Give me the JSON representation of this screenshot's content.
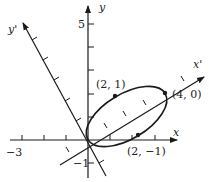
{
  "diagram": {
    "type": "rotated-axes-ellipse",
    "axes": {
      "x": {
        "label": "x",
        "tick_labels": {
          "min": "−3"
        }
      },
      "y": {
        "label": "y",
        "tick_labels": {
          "max": "5",
          "min": "−1"
        }
      },
      "x_prime": {
        "label": "x'"
      },
      "y_prime": {
        "label": "y'"
      }
    },
    "points": [
      {
        "label": "(2, 1)",
        "coords": [
          2,
          1
        ]
      },
      {
        "label": "(4, 0)",
        "coords": [
          4,
          0
        ]
      },
      {
        "label": "(2, −1)",
        "coords": [
          2,
          -1
        ]
      }
    ],
    "colors": {
      "stroke": "#1a1a1a",
      "background": "#ffffff"
    }
  }
}
